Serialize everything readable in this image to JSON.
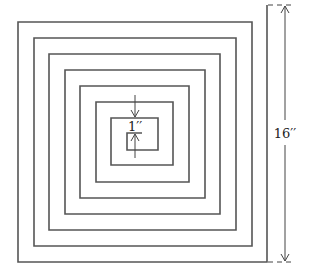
{
  "diagram": {
    "type": "square-spiral",
    "turns": 8,
    "line_color": "#555555",
    "dimension_color": "#444444",
    "labels": {
      "spacing": "1′′",
      "overall": "16′′"
    },
    "spacing_value": "1 inch",
    "overall_value": "16 inches"
  }
}
